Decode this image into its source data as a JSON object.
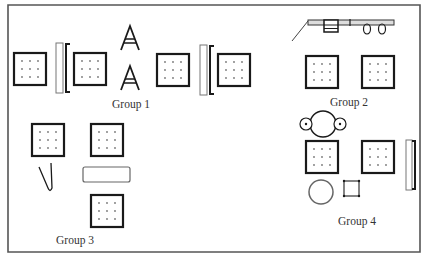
{
  "diagram": {
    "colors": {
      "stroke": "#222222",
      "frame": "#555555",
      "light": "#888888",
      "background": "#ffffff"
    },
    "groups": [
      {
        "id": "group-1",
        "label": "Group 1",
        "items": [
          "table-square",
          "bench",
          "table-square",
          "easel",
          "easel",
          "table-square",
          "bench",
          "table-square"
        ]
      },
      {
        "id": "group-2",
        "label": "Group 2",
        "items": [
          "wall-rail-with-hooks",
          "table-square",
          "table-square",
          "round-table-with-stools"
        ]
      },
      {
        "id": "group-3",
        "label": "Group 3",
        "items": [
          "table-square",
          "table-square",
          "hook",
          "rectangular-table",
          "table-square"
        ]
      },
      {
        "id": "group-4",
        "label": "Group 4",
        "items": [
          "table-square",
          "table-square",
          "bench",
          "round-rug",
          "small-square-stool"
        ]
      }
    ]
  }
}
